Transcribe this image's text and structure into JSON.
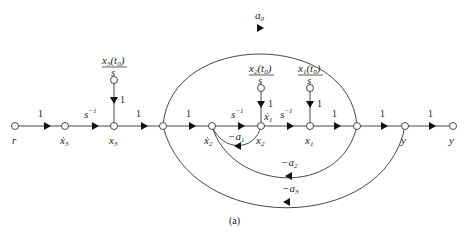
{
  "figure": {
    "caption": "(a)",
    "type": "signal-flow-graph"
  },
  "nodes": [
    {
      "id": "r",
      "label": "r"
    },
    {
      "id": "x3dot",
      "label": "ẋ",
      "sub": "3"
    },
    {
      "id": "x3",
      "label": "x",
      "sub": "3"
    },
    {
      "id": "n4",
      "label": ""
    },
    {
      "id": "x2dot",
      "label": "ẋ",
      "sub": "2"
    },
    {
      "id": "x1dot_x2",
      "label_top": "ẋ",
      "sub_top": "1",
      "label": "x",
      "sub": "2"
    },
    {
      "id": "x1",
      "label": "x",
      "sub": "1"
    },
    {
      "id": "n7",
      "label": ""
    },
    {
      "id": "y_mid",
      "label": "y"
    },
    {
      "id": "y_out",
      "label": "y"
    }
  ],
  "initial_conditions": [
    {
      "num": "x",
      "num_sub": "3",
      "arg": "(t",
      "arg_sub": "0",
      "close": ")",
      "den": "s",
      "gain": "1"
    },
    {
      "num": "x",
      "num_sub": "2",
      "arg": "(t",
      "arg_sub": "0",
      "close": ")",
      "den": "s",
      "gain": "1"
    },
    {
      "num": "x",
      "num_sub": "1",
      "arg": "(t",
      "arg_sub": "0",
      "close": ")",
      "den": "s",
      "gain": "1"
    }
  ],
  "gains": {
    "r_x3dot": "1",
    "x3dot_x3": "s",
    "x3dot_x3_exp": "−1",
    "x3_n4": "1",
    "n4_x2dot": "1",
    "x2dot_x1dot": "s",
    "x2dot_x1dot_exp": "−1",
    "x1dot_x1": "s",
    "x1dot_x1_exp": "−1",
    "x1_n7": "1",
    "n7_ymid": "1",
    "ymid_yout": "1",
    "feedforward": "a",
    "feedforward_sub": "0",
    "fb1": "−a",
    "fb1_sub": "1",
    "fb2": "−a",
    "fb2_sub": "2",
    "fb3": "−a",
    "fb3_sub": "3"
  }
}
